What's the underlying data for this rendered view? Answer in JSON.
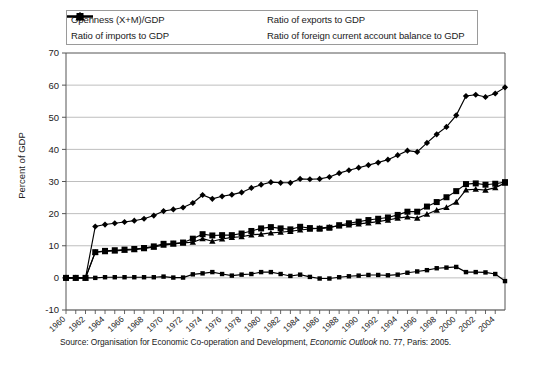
{
  "chart_data": {
    "type": "line",
    "title": "",
    "xlabel": "",
    "ylabel": "Percent of GDP",
    "ylim": [
      -10,
      70
    ],
    "ytick_step": 10,
    "yticks": [
      -10,
      0,
      10,
      20,
      30,
      40,
      50,
      60,
      70
    ],
    "xlim": [
      1960,
      2005
    ],
    "grid": true,
    "legend_position": "top",
    "source": "Source: Organisation for Economic Co-operation and Development, ",
    "source_italic": "Economic Outlook",
    "source_tail": " no. 77, Paris: 2005.",
    "x": [
      1960,
      1961,
      1962,
      1963,
      1964,
      1965,
      1966,
      1967,
      1968,
      1969,
      1970,
      1971,
      1972,
      1973,
      1974,
      1975,
      1976,
      1977,
      1978,
      1979,
      1980,
      1981,
      1982,
      1983,
      1984,
      1985,
      1986,
      1987,
      1988,
      1989,
      1990,
      1991,
      1992,
      1993,
      1994,
      1995,
      1996,
      1997,
      1998,
      1999,
      2000,
      2001,
      2002,
      2003,
      2004,
      2005
    ],
    "xticklabels": [
      "1960",
      "1962",
      "1964",
      "1966",
      "1968",
      "1970",
      "1972",
      "1974",
      "1976",
      "1978",
      "1980",
      "1982",
      "1984",
      "1986",
      "1988",
      "1990",
      "1992",
      "1994",
      "1996",
      "1998",
      "2000",
      "2002",
      "2004"
    ],
    "series": [
      {
        "name": "Openness (X+M)/GDP",
        "marker": "diamond",
        "values": [
          0,
          0,
          0,
          16.0,
          16.6,
          17.0,
          17.4,
          17.8,
          18.4,
          19.4,
          20.8,
          21.3,
          21.9,
          23.3,
          25.8,
          24.6,
          25.4,
          25.9,
          26.6,
          28.0,
          29.0,
          29.8,
          29.6,
          29.6,
          30.8,
          30.7,
          30.8,
          31.4,
          32.6,
          33.5,
          34.3,
          35.1,
          35.9,
          36.8,
          38.2,
          39.6,
          39.2,
          42.0,
          44.7,
          47.0,
          50.6,
          56.6,
          57.0,
          56.3,
          57.4,
          59.3
        ]
      },
      {
        "name": "Ratio of exports to GDP",
        "marker": "square",
        "values": [
          0,
          0,
          0,
          8.0,
          8.4,
          8.6,
          8.8,
          9.0,
          9.3,
          9.8,
          10.6,
          10.7,
          11.0,
          12.2,
          13.6,
          13.2,
          13.3,
          13.3,
          13.8,
          14.6,
          15.4,
          15.8,
          15.4,
          15.1,
          15.9,
          15.5,
          15.3,
          15.6,
          16.4,
          17.0,
          17.5,
          18.0,
          18.4,
          18.8,
          19.6,
          20.6,
          20.6,
          22.2,
          23.6,
          25.1,
          27.0,
          29.2,
          29.4,
          29.0,
          29.3,
          29.8
        ]
      },
      {
        "name": "Ratio of imports to GDP",
        "marker": "triangle",
        "values": [
          0,
          0,
          0,
          8.0,
          8.2,
          8.4,
          8.6,
          8.8,
          9.1,
          9.6,
          10.2,
          10.6,
          10.9,
          11.1,
          12.2,
          11.4,
          12.1,
          12.6,
          12.8,
          13.4,
          13.6,
          14.0,
          14.2,
          14.5,
          14.9,
          15.2,
          15.5,
          15.8,
          16.2,
          16.5,
          16.8,
          17.1,
          17.5,
          18.0,
          18.6,
          19.0,
          18.6,
          19.8,
          21.1,
          21.9,
          23.6,
          27.4,
          27.6,
          27.3,
          28.1,
          29.5
        ]
      },
      {
        "name": "Ratio of foreign current account balance to GDP",
        "marker": "small-square",
        "values": [
          0,
          0,
          0,
          0.0,
          0.2,
          0.2,
          0.2,
          0.2,
          0.2,
          0.2,
          0.4,
          0.1,
          0.1,
          1.1,
          1.4,
          1.8,
          1.2,
          0.7,
          1.0,
          1.2,
          1.8,
          1.8,
          1.2,
          0.6,
          1.0,
          0.3,
          -0.2,
          -0.2,
          0.2,
          0.5,
          0.7,
          0.9,
          0.9,
          0.8,
          1.0,
          1.6,
          2.0,
          2.4,
          3.0,
          3.2,
          3.4,
          1.8,
          1.8,
          1.7,
          1.2,
          -1.0
        ]
      }
    ]
  },
  "legend": {
    "items": [
      {
        "label": "Openness (X+M)/GDP",
        "marker": "diamond"
      },
      {
        "label": "Ratio of exports to GDP",
        "marker": "square"
      },
      {
        "label": "Ratio of imports to GDP",
        "marker": "triangle"
      },
      {
        "label": "Ratio of foreign current account balance to GDP",
        "marker": "small-square"
      }
    ]
  },
  "colors": {
    "line": "#000000",
    "grid": "#b7b7b7",
    "axis": "#555555",
    "text": "#1a1a1a"
  }
}
